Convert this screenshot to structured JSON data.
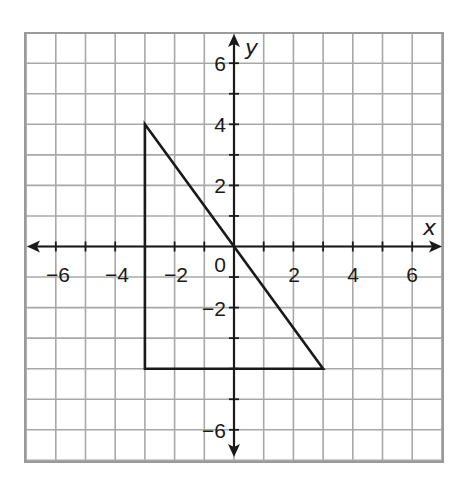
{
  "chart_data": {
    "type": "line",
    "title": "",
    "xlabel": "x",
    "ylabel": "y",
    "xlim": [
      -7,
      7
    ],
    "ylim": [
      -7,
      7
    ],
    "grid": true,
    "x_ticks": [
      -6,
      -4,
      -2,
      2,
      4,
      6
    ],
    "y_ticks": [
      -6,
      -2,
      2,
      4,
      6
    ],
    "x_tick_labels": [
      "−6",
      "−4",
      "−2",
      "2",
      "4",
      "6"
    ],
    "y_tick_labels": [
      "6",
      "4",
      "2",
      "−2",
      "−6"
    ],
    "origin_label": "0",
    "series": [
      {
        "name": "triangle",
        "shape": "polygon",
        "closed": true,
        "points": [
          {
            "x": -3,
            "y": 4
          },
          {
            "x": -3,
            "y": -4
          },
          {
            "x": 3,
            "y": -4
          }
        ]
      }
    ]
  },
  "colors": {
    "grid": "#a8a8a8",
    "border": "#9a9a9a",
    "axis": "#1a1a1a",
    "shape": "#1a1a1a"
  }
}
